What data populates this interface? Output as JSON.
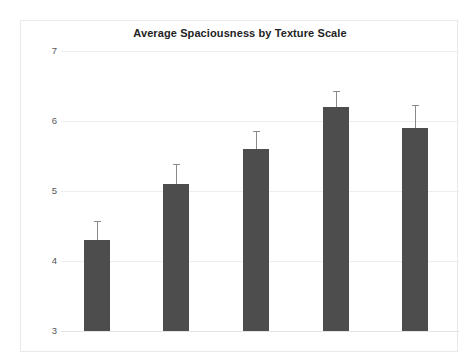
{
  "chart_data": {
    "type": "bar",
    "title": "Average Spaciousness by Texture Scale",
    "xlabel": "",
    "ylabel": "",
    "categories": [
      "XL",
      "L",
      "M",
      "S",
      "solid"
    ],
    "values": [
      4.3,
      5.1,
      5.6,
      6.2,
      5.9
    ],
    "errors": [
      0.27,
      0.29,
      0.26,
      0.23,
      0.33
    ],
    "error_type": "symmetric",
    "ylim": [
      3,
      7
    ],
    "yticks": [
      3,
      4,
      5,
      6,
      7
    ],
    "ytick_labels": [
      "3",
      "4",
      "5",
      "6",
      "7"
    ],
    "grid": true,
    "grid_axis": "y",
    "legend": false,
    "bar_color": "#4d4d4d",
    "errorbar_color": "#8a8a8e",
    "gridline_color": "#ededf0",
    "background_color": "#ffffff",
    "frame_color": "#e9e9ec"
  }
}
